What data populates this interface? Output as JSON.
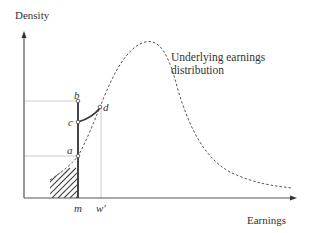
{
  "axes": {
    "y_label": "Density",
    "x_label": "Earnings"
  },
  "curve": {
    "label": "Underlying earnings distribution",
    "style": "dashed"
  },
  "points": {
    "a": "a",
    "b": "b",
    "c": "c",
    "d": "d"
  },
  "ticks": {
    "m": "m",
    "w_prime": "w'"
  },
  "colors": {
    "axis": "#555555",
    "curve": "#555555",
    "guide": "#cccccc",
    "spike": "#444444",
    "hatch": "#444444"
  }
}
